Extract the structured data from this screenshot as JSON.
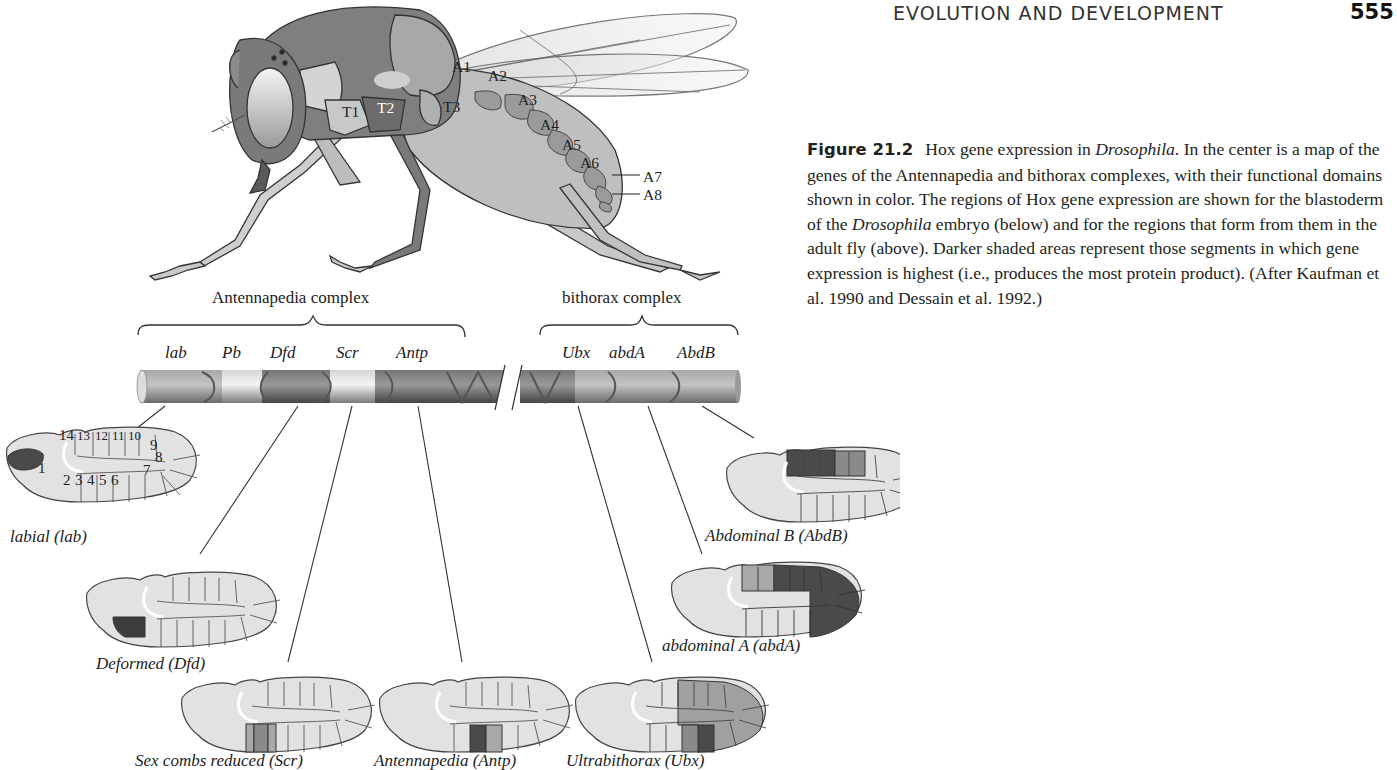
{
  "header": {
    "running_head": "EVOLUTION AND DEVELOPMENT",
    "page_number": "555"
  },
  "caption": {
    "figure_label": "Figure 21.2",
    "title_text": "Hox gene expression in ",
    "organism": "Drosophila",
    "after_title": ". In the center is a map of the genes of the Antennapedia and bithorax complexes, with their functional domains shown in color. The regions of Hox gene expression are shown for the blastoderm of the ",
    "organism2": "Drosophila",
    "body_rest": " embryo (below) and for the regions that form from them in the adult fly (above). Darker shaded areas represent those segments in which gene expression is highest (i.e., produces the most protein product). (After Kaufman et al. 1990 and Dessain et al. 1992.)"
  },
  "fly": {
    "thorax_labels": [
      "T1",
      "T2",
      "T3"
    ],
    "abdomen_labels": [
      "A1",
      "A2",
      "A3",
      "A4",
      "A5",
      "A6",
      "A7",
      "A8"
    ]
  },
  "complexes": {
    "antennapedia": {
      "label": "Antennapedia complex",
      "genes": [
        "lab",
        "Pb",
        "Dfd",
        "Scr",
        "Antp"
      ]
    },
    "bithorax": {
      "label": "bithorax complex",
      "genes": [
        "Ubx",
        "abdA",
        "AbdB"
      ]
    }
  },
  "embryo_segments": [
    "1",
    "2",
    "3",
    "4",
    "5",
    "6",
    "7",
    "8",
    "9",
    "10",
    "11",
    "12",
    "13",
    "14"
  ],
  "embryos": [
    {
      "name": "labial (lab)"
    },
    {
      "name": "Deformed (Dfd)"
    },
    {
      "name": "Sex combs reduced (Scr)"
    },
    {
      "name": "Antennapedia (Antp)"
    },
    {
      "name": "Ultrabithorax (Ubx)"
    },
    {
      "name": "abdominal A (abdA)"
    },
    {
      "name": "Abdominal B (AbdB)"
    }
  ],
  "colors": {
    "light": "#e2e2e2",
    "mid": "#a8a8a8",
    "dark": "#5e5e5e",
    "darkest": "#3c3c3c",
    "outline": "#444444"
  }
}
